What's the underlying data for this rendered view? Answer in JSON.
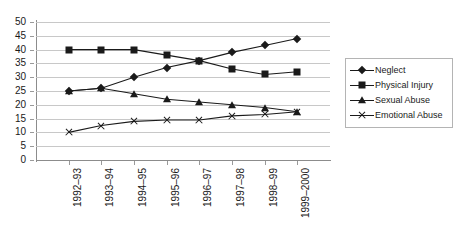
{
  "chart_data": {
    "type": "line",
    "title": "",
    "xlabel": "",
    "ylabel": "",
    "ylim": [
      0,
      50
    ],
    "y_ticks": [
      0,
      5,
      10,
      15,
      20,
      25,
      30,
      35,
      40,
      45,
      50
    ],
    "grid": true,
    "legend_position": "right",
    "categories": [
      "1992–93",
      "1993–94",
      "1994–95",
      "1995–96",
      "1996–97",
      "1997–98",
      "1998–99",
      "1999–2000"
    ],
    "series": [
      {
        "name": "Neglect",
        "marker": "diamond",
        "values": [
          25,
          26,
          30,
          33.5,
          36,
          39,
          41.5,
          44
        ]
      },
      {
        "name": "Physical Injury",
        "marker": "square",
        "values": [
          40,
          40,
          40,
          38,
          36,
          33,
          31,
          32
        ]
      },
      {
        "name": "Sexual Abuse",
        "marker": "triangle",
        "values": [
          25,
          26,
          24,
          22,
          21,
          20,
          19,
          17.5
        ]
      },
      {
        "name": "Emotional Abuse",
        "marker": "x",
        "values": [
          10,
          12.5,
          14,
          14.5,
          14.5,
          16,
          16.5,
          17.5
        ]
      }
    ]
  },
  "legend": {
    "items": [
      {
        "label": "Neglect",
        "marker": "diamond"
      },
      {
        "label": "Physical Injury",
        "marker": "square"
      },
      {
        "label": "Sexual Abuse",
        "marker": "square"
      },
      {
        "label": "Emotional Abuse",
        "marker": "x"
      }
    ]
  },
  "colors": {
    "series": "#1a1a1a",
    "gridline": "#c8c8c8",
    "axis": "#8c8c8c",
    "legend_border": "#b4b4b4",
    "background": "#ffffff"
  }
}
